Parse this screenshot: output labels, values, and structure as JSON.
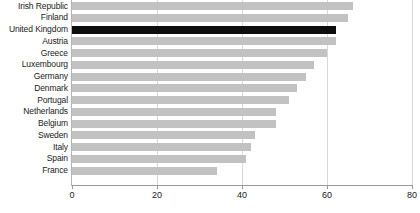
{
  "chart_data": {
    "type": "bar",
    "orientation": "horizontal",
    "title": "",
    "subtitle": "",
    "xlabel": "",
    "ylabel": "",
    "xlim": [
      0,
      80
    ],
    "xticks": [
      "0",
      "20",
      "40",
      "60",
      "80"
    ],
    "xtick_values": [
      0,
      20,
      40,
      60,
      80
    ],
    "grid": "vertical",
    "legend": "none",
    "highlight_category": "United Kingdom",
    "colors": {
      "bar": "#c2c2c2",
      "highlight_bar": "#0d0d0d",
      "gridline": "#d8d8d8",
      "axis": "#9a9a9a",
      "text": "#1a1a1a",
      "background": "#ffffff"
    },
    "categories": [
      "Irish Republic",
      "Finland",
      "United Kingdom",
      "Austria",
      "Greece",
      "Luxembourg",
      "Germany",
      "Denmark",
      "Portugal",
      "Netherlands",
      "Belgium",
      "Sweden",
      "Italy",
      "Spain",
      "France"
    ],
    "values": [
      66,
      65,
      62,
      62,
      60,
      57,
      55,
      53,
      51,
      48,
      48,
      43,
      42,
      41,
      34
    ]
  }
}
